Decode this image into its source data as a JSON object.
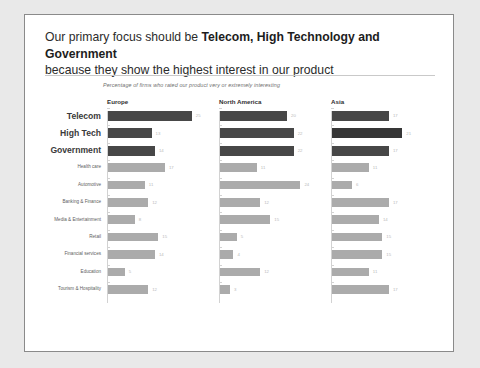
{
  "slide": {
    "title_plain_1": "Our primary focus should be ",
    "title_bold": "Telecom, High Technology and Government",
    "title_plain_2": "because they show the highest interest in our product",
    "subtitle": "Percentage of firms who rated our product very or extremely interesting"
  },
  "colors": {
    "bar_dark": "#474747",
    "bar_darker": "#363636",
    "bar_light": "#ababab",
    "card_bg": "#ffffff",
    "page_bg": "#e9e9e9",
    "border": "#8a8a8a"
  },
  "chart_data": {
    "type": "bar",
    "title": "Percentage of firms who rated our product very or extremely interesting",
    "xlabel": "",
    "ylabel": "",
    "orientation": "horizontal",
    "grid": false,
    "legend": "none",
    "xlim": [
      0,
      25
    ],
    "panels": [
      "Europe",
      "North America",
      "Asia"
    ],
    "categories": [
      "Telecom",
      "High Tech",
      "Government",
      "Health care",
      "Automotive",
      "Banking & Finance",
      "Media & Entertainment",
      "Retail",
      "Financial services",
      "Education",
      "Tourism & Hospitality"
    ],
    "highlighted_categories": [
      "Telecom",
      "High Tech",
      "Government"
    ],
    "series": [
      {
        "name": "Europe",
        "values": [
          25,
          13,
          14,
          17,
          11,
          12,
          8,
          15,
          14,
          5,
          12
        ]
      },
      {
        "name": "North America",
        "values": [
          20,
          22,
          22,
          11,
          24,
          12,
          15,
          5,
          4,
          12,
          3
        ]
      },
      {
        "name": "Asia",
        "values": [
          17,
          21,
          17,
          11,
          6,
          17,
          14,
          15,
          15,
          11,
          17
        ]
      }
    ]
  }
}
